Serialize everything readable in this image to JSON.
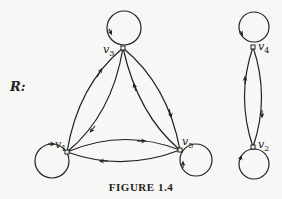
{
  "relation_label": "R:",
  "caption": "FIGURE 1.4",
  "vertices": [
    {
      "id": "v1",
      "name": "v",
      "sub": "1"
    },
    {
      "id": "v2",
      "name": "v",
      "sub": "2"
    },
    {
      "id": "v3",
      "name": "v",
      "sub": "3"
    },
    {
      "id": "v4",
      "name": "v",
      "sub": "4"
    },
    {
      "id": "v5",
      "name": "v",
      "sub": "5"
    }
  ],
  "edges": [
    {
      "from": "v1",
      "to": "v1",
      "type": "loop"
    },
    {
      "from": "v2",
      "to": "v2",
      "type": "loop"
    },
    {
      "from": "v3",
      "to": "v3",
      "type": "loop"
    },
    {
      "from": "v4",
      "to": "v4",
      "type": "loop"
    },
    {
      "from": "v5",
      "to": "v5",
      "type": "loop"
    },
    {
      "from": "v1",
      "to": "v3"
    },
    {
      "from": "v3",
      "to": "v1"
    },
    {
      "from": "v3",
      "to": "v5"
    },
    {
      "from": "v5",
      "to": "v3"
    },
    {
      "from": "v1",
      "to": "v5"
    },
    {
      "from": "v5",
      "to": "v1"
    },
    {
      "from": "v4",
      "to": "v2"
    },
    {
      "from": "v2",
      "to": "v4"
    }
  ],
  "colors": {
    "ink": "#222222",
    "background": "#f7f7f5"
  }
}
